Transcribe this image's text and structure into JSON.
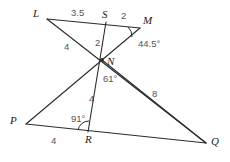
{
  "figure": {
    "stroke_color": "#2b2b2b",
    "label_color": "#1a1a1a",
    "measure_color": "#555555",
    "background": "#ffffff"
  },
  "vertices": [
    {
      "name": "L",
      "label": "L",
      "x": 47,
      "y": 19,
      "label_x": 33,
      "label_y": 8
    },
    {
      "name": "S",
      "label": "S",
      "x": 106,
      "y": 22,
      "label_x": 102,
      "label_y": 9
    },
    {
      "name": "M",
      "label": "M",
      "x": 140,
      "y": 28,
      "label_x": 143,
      "label_y": 15
    },
    {
      "name": "N",
      "label": "N",
      "x": 102,
      "y": 60,
      "label_x": 107,
      "label_y": 56
    },
    {
      "name": "P",
      "label": "P",
      "x": 26,
      "y": 124,
      "label_x": 10,
      "label_y": 115
    },
    {
      "name": "R",
      "label": "R",
      "x": 88,
      "y": 132,
      "label_x": 85,
      "label_y": 134
    },
    {
      "name": "Q",
      "label": "Q",
      "x": 206,
      "y": 143,
      "label_x": 211,
      "label_y": 136
    }
  ],
  "segments": [
    {
      "name": "segment-L-M",
      "from": "L",
      "to": "M"
    },
    {
      "name": "segment-L-Q",
      "from": "L",
      "to": "Q"
    },
    {
      "name": "segment-M-N",
      "from": "M",
      "to": "N"
    },
    {
      "name": "segment-S-R",
      "from": "S",
      "to": "R"
    },
    {
      "name": "segment-P-N",
      "from": "P",
      "to": "N"
    },
    {
      "name": "segment-N-Q",
      "from": "N",
      "to": "Q"
    },
    {
      "name": "segment-P-Q",
      "from": "P",
      "to": "Q"
    }
  ],
  "measures": {
    "ls": {
      "text": "3.5",
      "x": 71,
      "y": 8
    },
    "sm": {
      "text": "2",
      "x": 121,
      "y": 11
    },
    "ln": {
      "text": "4",
      "x": 64,
      "y": 42
    },
    "sn": {
      "text": "2",
      "x": 95,
      "y": 38
    },
    "angle_m": {
      "text": "44.5°",
      "x": 138,
      "y": 39
    },
    "angle_n": {
      "text": "61°",
      "x": 103,
      "y": 74
    },
    "nr": {
      "text": "4",
      "x": 89,
      "y": 94
    },
    "nq": {
      "text": "8",
      "x": 152,
      "y": 89
    },
    "angle_r": {
      "text": "91°",
      "x": 71,
      "y": 114
    },
    "pr": {
      "text": "4",
      "x": 51,
      "y": 136
    }
  }
}
